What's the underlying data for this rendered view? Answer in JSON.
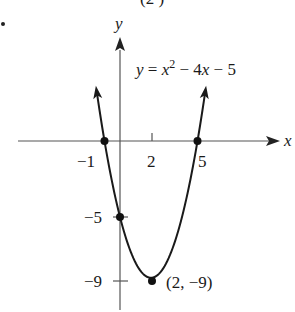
{
  "header": {
    "clipped_top_text": "(2        )",
    "bullet": "•"
  },
  "chart_data": {
    "type": "line",
    "title": "",
    "equation": {
      "prefix": "y = x",
      "exponent": "2",
      "suffix": " − 4x − 5"
    },
    "xlabel": "x",
    "ylabel": "y",
    "x_ticks": [
      {
        "value": -1,
        "label": "−1"
      },
      {
        "value": 2,
        "label": "2"
      },
      {
        "value": 5,
        "label": "5"
      }
    ],
    "y_ticks": [
      {
        "value": -5,
        "label": "−5"
      },
      {
        "value": -9,
        "label": "−9"
      }
    ],
    "series": [
      {
        "name": "y = x^2 - 4x - 5",
        "function": "x^2 - 4x - 5",
        "x_range": [
          -1.5,
          5.5
        ],
        "points": [
          {
            "x": -1.5,
            "y": 3.25
          },
          {
            "x": -1,
            "y": 0
          },
          {
            "x": 0,
            "y": -5
          },
          {
            "x": 1,
            "y": -8
          },
          {
            "x": 2,
            "y": -9
          },
          {
            "x": 3,
            "y": -8
          },
          {
            "x": 4,
            "y": -5
          },
          {
            "x": 5,
            "y": 0
          },
          {
            "x": 5.5,
            "y": 3.25
          }
        ]
      }
    ],
    "marked_points": [
      {
        "x": -1,
        "y": 0,
        "label": ""
      },
      {
        "x": 5,
        "y": 0,
        "label": ""
      },
      {
        "x": 0,
        "y": -5,
        "label": ""
      },
      {
        "x": 2,
        "y": -9,
        "label": "(2, −9)"
      }
    ],
    "xlim": [
      -6.5,
      10.3
    ],
    "ylim": [
      -11.2,
      9
    ],
    "grid": false,
    "legend": "none",
    "colors": {
      "curve": "#1a1a1a",
      "axis": "#555555",
      "point": "#111111"
    }
  }
}
